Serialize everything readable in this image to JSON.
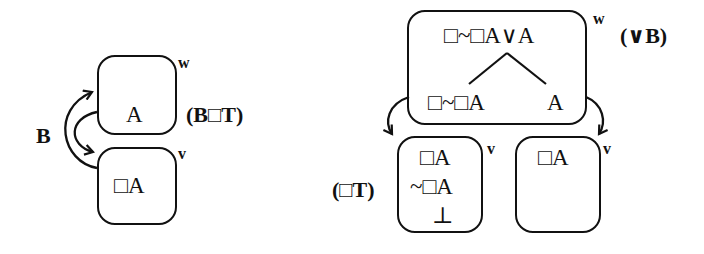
{
  "left_diagram": {
    "world_w": {
      "label": "w",
      "formula": "A"
    },
    "world_v": {
      "label": "v",
      "formula": "□A"
    },
    "arrow_label": "B",
    "rule_label": "(B□T)"
  },
  "right_diagram": {
    "world_w": {
      "label": "w",
      "formula_top": "□~□A∨A",
      "branch_left": "□~□A",
      "branch_right": "A"
    },
    "world_v_left": {
      "label": "v",
      "lines": [
        "□A",
        "~□A",
        "⊥"
      ]
    },
    "world_v_right": {
      "label": "v",
      "lines": [
        "□A"
      ]
    },
    "rule_top": "(∨B)",
    "rule_left": "(□T)"
  }
}
